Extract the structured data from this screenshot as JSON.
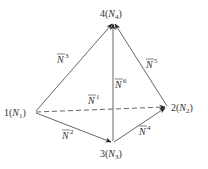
{
  "diagram": {
    "title": "",
    "colors": {
      "line": "#555555",
      "text": "#333333",
      "background": "#ffffff"
    },
    "nodes": [
      {
        "id": "1",
        "label_num": "1",
        "label_sub": "1",
        "label": "1(N1)",
        "x": 35,
        "y": 112
      },
      {
        "id": "2",
        "label_num": "2",
        "label_sub": "2",
        "label": "2(N2)",
        "x": 167,
        "y": 107
      },
      {
        "id": "3",
        "label_num": "3",
        "label_sub": "3",
        "label": "3(N3)",
        "x": 113,
        "y": 143
      },
      {
        "id": "4",
        "label_num": "4",
        "label_sub": "4",
        "label": "4(N4)",
        "x": 113,
        "y": 22
      }
    ],
    "edges": [
      {
        "id": "N1",
        "sup": "1",
        "from": "1",
        "to": "2",
        "style": "dashed"
      },
      {
        "id": "N2",
        "sup": "2",
        "from": "1",
        "to": "3",
        "style": "solid"
      },
      {
        "id": "N3",
        "sup": "3",
        "from": "1",
        "to": "4",
        "style": "solid"
      },
      {
        "id": "N4",
        "sup": "4",
        "from": "3",
        "to": "2",
        "style": "solid"
      },
      {
        "id": "N5",
        "sup": "5",
        "from": "2",
        "to": "4",
        "style": "solid"
      },
      {
        "id": "N6",
        "sup": "6",
        "from": "3",
        "to": "4",
        "style": "solid"
      }
    ],
    "vector_symbol": "N"
  }
}
